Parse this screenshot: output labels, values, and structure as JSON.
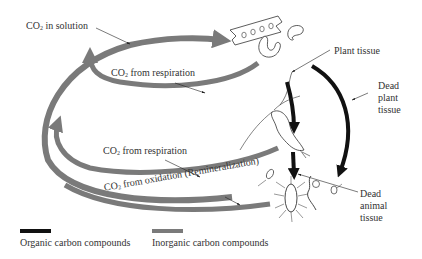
{
  "colors": {
    "organic": "#111111",
    "inorganic": "#7a7a7a",
    "text": "#333333",
    "background": "#ffffff"
  },
  "labels": {
    "co2_in_solution": {
      "prefix": "CO",
      "sub": "2",
      "suffix": " in solution"
    },
    "co2_respiration_upper": {
      "prefix": "CO",
      "sub": "2",
      "suffix": " from respiration"
    },
    "co2_respiration_lower": {
      "prefix": "CO",
      "sub": "2",
      "suffix": " from respiration"
    },
    "co2_oxidation": {
      "prefix": "CO",
      "sub": "2",
      "suffix": " from oxidation (Remineralization)"
    },
    "plant_tissue": "Plant tissue",
    "dead_plant_tissue": "Dead\nplant\ntissue",
    "dead_animal_tissue": "Dead\nanimal\ntissue"
  },
  "legend": [
    {
      "label": "Organic carbon compounds",
      "color": "#111111"
    },
    {
      "label": "Inorganic carbon compounds",
      "color": "#7a7a7a"
    }
  ],
  "organisms": [
    {
      "name": "phytoplankton-chain",
      "role": "plant"
    },
    {
      "name": "dinoflagellate",
      "role": "plant"
    },
    {
      "name": "copepod",
      "role": "animal"
    },
    {
      "name": "bacterium",
      "role": "decomposer"
    },
    {
      "name": "protozoa",
      "role": "decomposer"
    }
  ]
}
